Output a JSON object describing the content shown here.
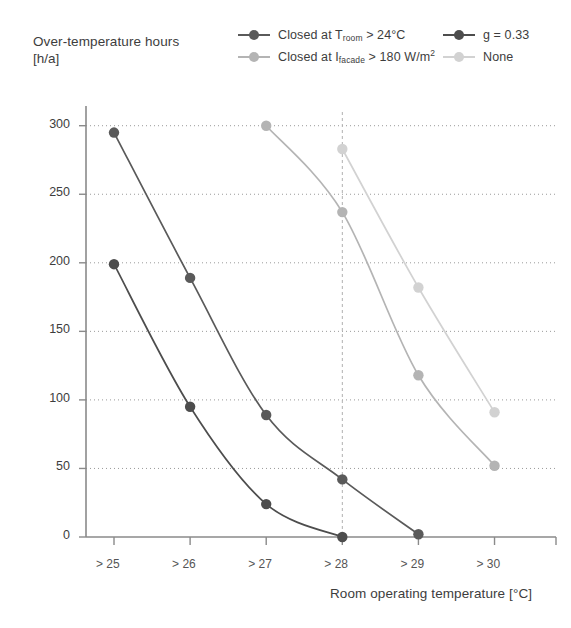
{
  "axis_titles": {
    "y_line1": "Over-temperature hours",
    "y_line2": "[h/a]",
    "x": "Room operating temperature [°C]"
  },
  "legend": {
    "position": "top",
    "entries": [
      {
        "id": "closed-troom",
        "label_pre": "Closed at T",
        "label_sub": "room",
        "label_post": " > 24°C",
        "color": "#5a5a5a"
      },
      {
        "id": "g033",
        "label_pre": "g = 0.33",
        "label_sub": "",
        "label_post": "",
        "color": "#4d4d4d"
      },
      {
        "id": "closed-ifacade",
        "label_pre": "Closed at I",
        "label_sub": "facade",
        "label_post": " > 180 W/m",
        "label_sup": "2",
        "color": "#b4b4b4"
      },
      {
        "id": "none",
        "label_pre": "None",
        "label_sub": "",
        "label_post": "",
        "color": "#d2d2d2"
      }
    ]
  },
  "chart_data": {
    "type": "line",
    "title": "",
    "xlabel": "Room operating temperature [°C]",
    "ylabel": "Over-temperature hours [h/a]",
    "categories": [
      "> 25",
      "> 26",
      "> 27",
      "> 28",
      "> 29",
      "> 30"
    ],
    "ylim": [
      0,
      310
    ],
    "yticks": [
      0,
      50,
      100,
      150,
      200,
      250,
      300
    ],
    "grid": "horizontal-dotted",
    "highlight_gridline_x": "> 28",
    "series": [
      {
        "name": "Closed at T_room > 24°C",
        "color": "#5a5a5a",
        "values": [
          295,
          189,
          89,
          42,
          2,
          null
        ]
      },
      {
        "name": "g = 0.33",
        "color": "#4d4d4d",
        "values": [
          199,
          95,
          24,
          0,
          null,
          null
        ]
      },
      {
        "name": "Closed at I_facade > 180 W/m2",
        "color": "#b4b4b4",
        "values": [
          null,
          null,
          300,
          237,
          118,
          52
        ]
      },
      {
        "name": "None",
        "color": "#d2d2d2",
        "values": [
          null,
          null,
          null,
          283,
          182,
          91
        ]
      }
    ]
  }
}
